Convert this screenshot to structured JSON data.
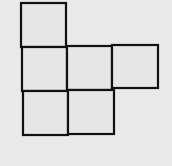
{
  "diagram": {
    "type": "net-of-squares",
    "background": "#e9e9e9",
    "fill": "#e6e6e6",
    "stroke": "#111111",
    "cells": [
      {
        "name": "top-left",
        "x": 21,
        "y": 3,
        "w": 45,
        "h": 44
      },
      {
        "name": "middle-left",
        "x": 22,
        "y": 47,
        "w": 45,
        "h": 44
      },
      {
        "name": "middle-center",
        "x": 67,
        "y": 46,
        "w": 45,
        "h": 44
      },
      {
        "name": "middle-right",
        "x": 112,
        "y": 45,
        "w": 46,
        "h": 43
      },
      {
        "name": "bottom-left",
        "x": 23,
        "y": 91,
        "w": 45,
        "h": 44
      },
      {
        "name": "bottom-center",
        "x": 68,
        "y": 90,
        "w": 46,
        "h": 44
      }
    ]
  }
}
